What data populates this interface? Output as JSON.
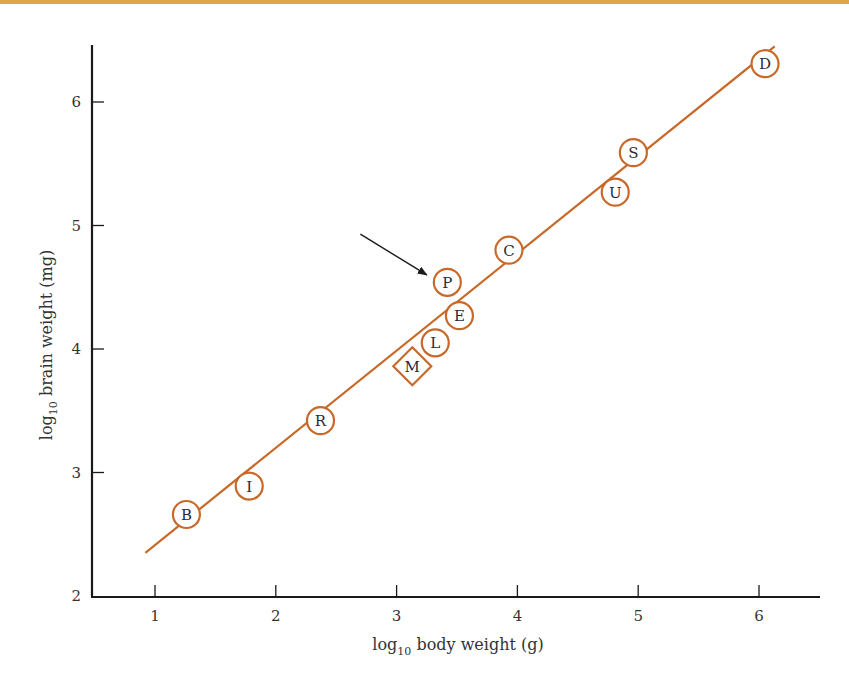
{
  "chart_data": {
    "type": "scatter",
    "title": "",
    "xlabel": "log10 body weight (g)",
    "ylabel": "log10 brain weight (mg)",
    "xlabel_parts": {
      "pre": "log",
      "sub": "10",
      "post": " body weight (g)"
    },
    "ylabel_parts": {
      "pre": "log",
      "sub": "10",
      "post": " brain weight (mg)"
    },
    "xlim": [
      0.5,
      6.5
    ],
    "ylim": [
      2,
      6.5
    ],
    "xticks": [
      1,
      2,
      3,
      4,
      5,
      6
    ],
    "yticks": [
      2,
      3,
      4,
      5,
      6
    ],
    "grid": false,
    "legend": null,
    "points": [
      {
        "label": "B",
        "x": 1.26,
        "y": 2.66,
        "marker": "circle"
      },
      {
        "label": "I",
        "x": 1.78,
        "y": 2.89,
        "marker": "circle"
      },
      {
        "label": "R",
        "x": 2.37,
        "y": 3.42,
        "marker": "circle"
      },
      {
        "label": "M",
        "x": 3.13,
        "y": 3.86,
        "marker": "diamond"
      },
      {
        "label": "L",
        "x": 3.32,
        "y": 4.05,
        "marker": "circle"
      },
      {
        "label": "E",
        "x": 3.52,
        "y": 4.27,
        "marker": "circle"
      },
      {
        "label": "P",
        "x": 3.42,
        "y": 4.54,
        "marker": "circle",
        "highlighted": true
      },
      {
        "label": "C",
        "x": 3.93,
        "y": 4.8,
        "marker": "circle"
      },
      {
        "label": "U",
        "x": 4.81,
        "y": 5.27,
        "marker": "circle"
      },
      {
        "label": "S",
        "x": 4.96,
        "y": 5.59,
        "marker": "circle"
      },
      {
        "label": "D",
        "x": 6.05,
        "y": 6.31,
        "marker": "circle"
      }
    ],
    "fit_line": {
      "x1": 0.92,
      "y1": 2.35,
      "x2": 6.13,
      "y2": 6.45
    },
    "annotations": [
      {
        "type": "arrow",
        "target": "P",
        "from": [
          2.7,
          4.93
        ],
        "to": [
          3.25,
          4.6
        ]
      }
    ],
    "colors": {
      "series": "#c8692a",
      "axis": "#1a1a1a",
      "text": "#333333",
      "top_rule": "#e0a64a"
    }
  }
}
